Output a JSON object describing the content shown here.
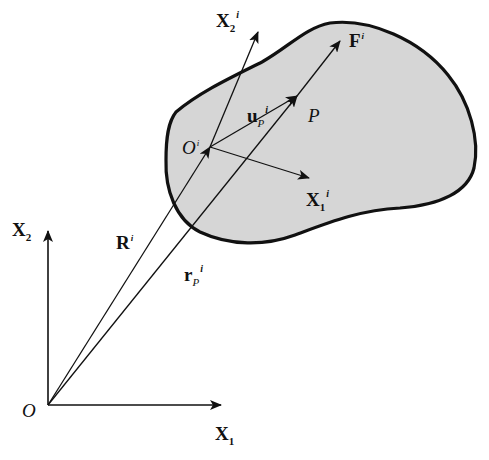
{
  "diagram": {
    "colors": {
      "body_fill": "#d6d6d6",
      "stroke": "#111111",
      "background": "#ffffff"
    },
    "global_frame": {
      "origin": "O",
      "x_axis": {
        "main": "X",
        "sub": "1"
      },
      "y_axis": {
        "main": "X",
        "sub": "2"
      }
    },
    "body_frame": {
      "origin": {
        "main": "O",
        "sup": "i"
      },
      "x_axis": {
        "main": "X",
        "sub": "1",
        "sup": "i"
      },
      "y_axis": {
        "main": "X",
        "sub": "2",
        "sup": "i"
      }
    },
    "point": "P",
    "vectors": {
      "R": {
        "main": "R",
        "sup": "i"
      },
      "r_P": {
        "main": "r",
        "sub": "P",
        "sup": "i"
      },
      "u_P": {
        "main": "u",
        "sub": "P",
        "sup": "i"
      },
      "F": {
        "main": "F",
        "sup": "i"
      }
    }
  }
}
